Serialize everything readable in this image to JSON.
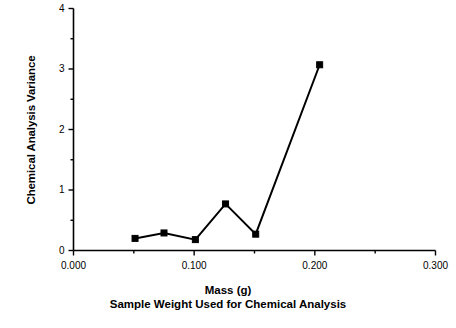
{
  "chart_data": {
    "type": "line",
    "title": "",
    "xlabel": "Mass (g)",
    "xlabel_sub": "Sample Weight Used for Chemical Analysis",
    "ylabel": "Chemical Analysis Variance",
    "xlim": [
      0.0,
      0.3
    ],
    "ylim": [
      0,
      4
    ],
    "grid": false,
    "legend": null,
    "marker": "square",
    "line_color": "#000000",
    "marker_color": "#000000",
    "background_color": "#ffffff",
    "x": [
      0.051,
      0.075,
      0.101,
      0.126,
      0.151,
      0.204
    ],
    "values": [
      0.2,
      0.29,
      0.18,
      0.77,
      0.27,
      3.07
    ],
    "series": [
      {
        "name": "Chemical Analysis Variance",
        "x": [
          0.051,
          0.075,
          0.101,
          0.126,
          0.151,
          0.204
        ],
        "values": [
          0.2,
          0.29,
          0.18,
          0.77,
          0.27,
          3.07
        ]
      }
    ],
    "xticks": [
      {
        "value": 0.0,
        "label": "0.000",
        "major": true
      },
      {
        "value": 0.05,
        "label": "",
        "major": false
      },
      {
        "value": 0.1,
        "label": "0.100",
        "major": true
      },
      {
        "value": 0.15,
        "label": "",
        "major": false
      },
      {
        "value": 0.2,
        "label": "0.200",
        "major": true
      },
      {
        "value": 0.25,
        "label": "",
        "major": false
      },
      {
        "value": 0.3,
        "label": "0.300",
        "major": true
      }
    ],
    "yticks": [
      {
        "value": 0,
        "label": "0",
        "major": true
      },
      {
        "value": 0.5,
        "label": "",
        "major": false
      },
      {
        "value": 1,
        "label": "1",
        "major": true
      },
      {
        "value": 1.5,
        "label": "",
        "major": false
      },
      {
        "value": 2,
        "label": "2",
        "major": true
      },
      {
        "value": 2.5,
        "label": "",
        "major": false
      },
      {
        "value": 3,
        "label": "3",
        "major": true
      },
      {
        "value": 3.5,
        "label": "",
        "major": false
      },
      {
        "value": 4,
        "label": "4",
        "major": true
      }
    ]
  }
}
